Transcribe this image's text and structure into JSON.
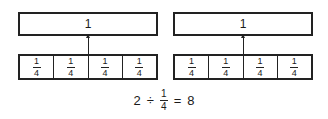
{
  "diagrams": [
    {
      "whole_label": "1",
      "parts": [
        "1",
        "1",
        "1",
        "1"
      ],
      "denominators": [
        "4",
        "4",
        "4",
        "4"
      ]
    },
    {
      "whole_label": "1",
      "parts": [
        "1",
        "1",
        "1",
        "1"
      ],
      "denominators": [
        "4",
        "4",
        "4",
        "4"
      ]
    }
  ],
  "equation": {
    "left": "2",
    "op": "÷",
    "num": "1",
    "den": "4",
    "eq": "=",
    "result": "8"
  }
}
